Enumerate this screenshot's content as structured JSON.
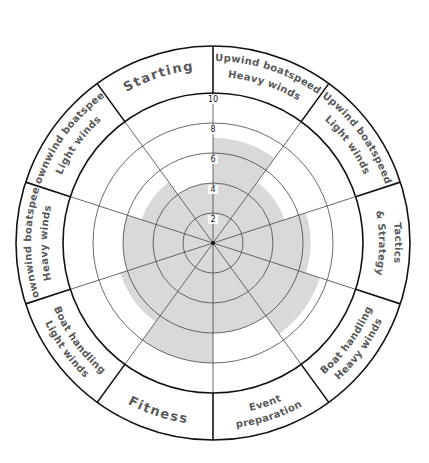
{
  "chart_data": {
    "type": "radar",
    "title": "",
    "center": [
      213,
      243
    ],
    "scale": {
      "min": 0,
      "max": 10,
      "ticks": [
        2,
        4,
        6,
        8,
        10
      ]
    },
    "grid": true,
    "shade_color": "#d9d9d9",
    "categories": [
      {
        "lines": [
          "Upwind boatspeed",
          "Heavy winds"
        ],
        "value": 7
      },
      {
        "lines": [
          "Upwind boatspeed",
          "Light winds"
        ],
        "value": 5
      },
      {
        "lines": [
          "Tactics",
          "& Strategy"
        ],
        "value": 6.5
      },
      {
        "lines": [
          "Boat handling",
          "Heavy winds"
        ],
        "value": 7.5
      },
      {
        "lines": [
          "Event",
          "preparation"
        ],
        "value": 6
      },
      {
        "lines": [
          "Fitness"
        ],
        "value": 8
      },
      {
        "lines": [
          "Boat handling",
          "Light winds"
        ],
        "value": 6.5
      },
      {
        "lines": [
          "Downwind boatspeed",
          "Heavy winds"
        ],
        "value": 6
      },
      {
        "lines": [
          "Downwind boatspeed",
          "Light winds"
        ],
        "value": 5
      },
      {
        "lines": [
          "Starting"
        ],
        "value": 4
      }
    ]
  }
}
